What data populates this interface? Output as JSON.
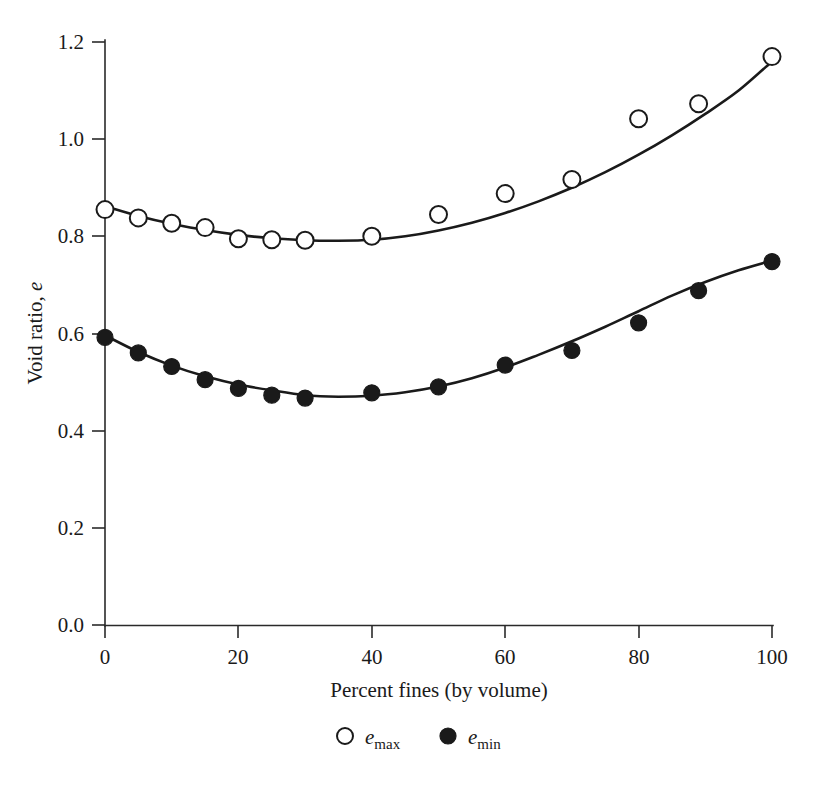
{
  "chart_data": {
    "type": "scatter",
    "title": "",
    "xlabel": "Percent fines (by volume)",
    "ylabel": "Void ratio, e",
    "xlim": [
      0,
      100
    ],
    "ylim": [
      0.0,
      1.2
    ],
    "xticks": [
      0,
      20,
      40,
      60,
      80,
      100
    ],
    "xtick_labels": [
      "0",
      "20",
      "40",
      "60",
      "80",
      "100"
    ],
    "yticks": [
      0.0,
      0.2,
      0.4,
      0.6,
      0.8,
      1.0,
      1.2
    ],
    "ytick_labels": [
      "0.0",
      "0.2",
      "0.4",
      "0.6",
      "0.8",
      "1.0",
      "1.2"
    ],
    "grid": false,
    "legend_position": "bottom-center",
    "series": [
      {
        "name": "e_max",
        "legend_label_base": "e",
        "legend_label_sub": "max",
        "marker": "open-circle",
        "color": "#1a1a1a",
        "x": [
          0,
          5,
          10,
          15,
          20,
          25,
          30,
          40,
          50,
          60,
          70,
          80,
          89,
          100
        ],
        "values": [
          0.855,
          0.838,
          0.827,
          0.818,
          0.795,
          0.793,
          0.792,
          0.8,
          0.845,
          0.888,
          0.917,
          1.042,
          1.073,
          1.17
        ]
      },
      {
        "name": "e_min",
        "legend_label_base": "e",
        "legend_label_sub": "min",
        "marker": "filled-circle",
        "color": "#1a1a1a",
        "x": [
          0,
          5,
          10,
          15,
          20,
          25,
          30,
          40,
          50,
          60,
          70,
          80,
          89,
          100
        ],
        "values": [
          0.592,
          0.56,
          0.532,
          0.505,
          0.487,
          0.473,
          0.467,
          0.478,
          0.49,
          0.535,
          0.565,
          0.622,
          0.688,
          0.748
        ]
      }
    ],
    "fit_curves": [
      {
        "name": "e_max_fit",
        "x": [
          0,
          5,
          10,
          15,
          20,
          25,
          30,
          35,
          40,
          45,
          50,
          55,
          60,
          65,
          70,
          75,
          80,
          85,
          90,
          95,
          100
        ],
        "values": [
          0.862,
          0.842,
          0.826,
          0.813,
          0.803,
          0.796,
          0.792,
          0.791,
          0.793,
          0.8,
          0.812,
          0.828,
          0.848,
          0.872,
          0.9,
          0.932,
          0.968,
          1.008,
          1.052,
          1.1,
          1.16
        ]
      },
      {
        "name": "e_min_fit",
        "x": [
          0,
          5,
          10,
          15,
          20,
          25,
          30,
          35,
          40,
          45,
          50,
          55,
          60,
          65,
          70,
          75,
          80,
          85,
          90,
          95,
          100
        ],
        "values": [
          0.596,
          0.562,
          0.534,
          0.512,
          0.495,
          0.483,
          0.473,
          0.47,
          0.472,
          0.479,
          0.491,
          0.508,
          0.53,
          0.556,
          0.584,
          0.614,
          0.646,
          0.678,
          0.706,
          0.73,
          0.75
        ]
      }
    ]
  },
  "axes": {
    "ylabel_base": "Void ratio, ",
    "ylabel_italic": "e",
    "xlabel": "Percent fines (by volume)"
  },
  "legend": {
    "items": [
      {
        "marker": "open-circle",
        "base": "e",
        "sub": "max"
      },
      {
        "marker": "filled-circle",
        "base": "e",
        "sub": "min"
      }
    ]
  },
  "colors": {
    "ink": "#1a1a1a",
    "axis": "#2a2a2a",
    "background": "#ffffff"
  }
}
